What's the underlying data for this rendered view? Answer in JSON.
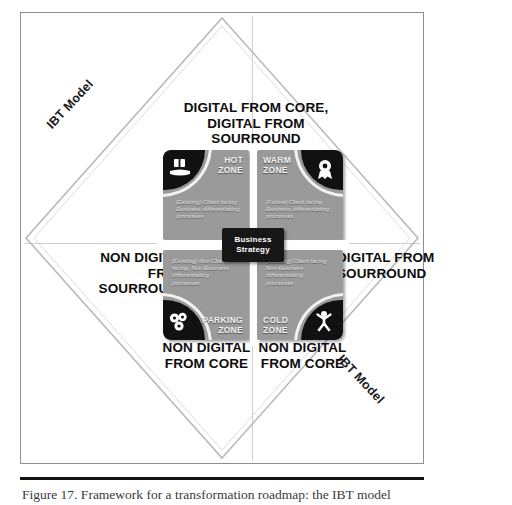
{
  "figure": {
    "caption": "Figure 17. Framework for a transformation roadmap: the IBT model",
    "model_name_top_left": "IBT Model",
    "model_name_bottom_right": "IBT Model"
  },
  "axes": {
    "top": "DIGITAL FROM CORE, DIGITAL FROM SOURROUND",
    "left": "NON DIGITAL FROM SOURROUND",
    "right": "DIGITAL FROM SOURROUND",
    "bottom_left": "NON DIGITAL FROM CORE",
    "bottom_right": "NON DIGITAL FROM CORE"
  },
  "center": {
    "line1": "Business",
    "line2": "Strategy"
  },
  "quadrants": [
    {
      "id": "hot",
      "name": "HOT ZONE",
      "name_line1": "HOT",
      "name_line2": "ZONE",
      "description": "(Existing) Client facing Business differentiating processes",
      "icon": "hand-holding-box-icon"
    },
    {
      "id": "warm",
      "name": "WARM ZONE",
      "name_line1": "WARM",
      "name_line2": "ZONE",
      "description": "(Future) Client facing Business differentiating processes",
      "icon": "award-ribbon-icon"
    },
    {
      "id": "parking",
      "name": "PARKING ZONE",
      "name_line1": "PARKING",
      "name_line2": "ZONE",
      "description": "(Existing) Non Client facing, Non Business differentiating processes",
      "icon": "gears-icon"
    },
    {
      "id": "cold",
      "name": "COLD ZONE",
      "name_line1": "COLD",
      "name_line2": "ZONE",
      "description": "(Existing) Client facing Non Business differentiating processes",
      "icon": "person-raised-arms-icon"
    }
  ],
  "colors": {
    "quadrant_fill": "#9a9a9a",
    "corner_fill": "#111111",
    "center_fill": "#171717",
    "text_dark": "#0d0d0d",
    "frame_border": "#8e8e8e",
    "diamond_stroke": "#b4b4b4"
  }
}
